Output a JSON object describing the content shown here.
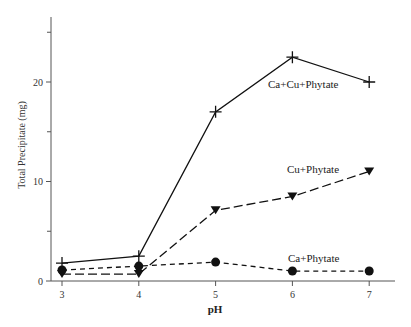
{
  "chart_data": {
    "type": "line",
    "title": "",
    "xlabel": "pH",
    "ylabel": "Total Precipitate (mg)",
    "x": [
      3,
      4,
      5,
      6,
      7
    ],
    "xticks": [
      "3",
      "4",
      "5",
      "6",
      "7"
    ],
    "yticks": [
      "0",
      "10",
      "20"
    ],
    "yminor_ticks": [
      5,
      15,
      25
    ],
    "ylim": [
      0,
      26.5
    ],
    "grid": false,
    "legend": "inline labels",
    "series": [
      {
        "name": "Ca+Cu+Phytate",
        "marker": "plus",
        "line": "solid",
        "values": [
          1.8,
          2.5,
          17.0,
          22.5,
          20.0
        ]
      },
      {
        "name": "Cu+Phytate",
        "marker": "triangle-down",
        "line": "long-dash",
        "values": [
          0.7,
          0.7,
          7.1,
          8.5,
          11.0
        ]
      },
      {
        "name": "Ca+Phytate",
        "marker": "circle",
        "line": "short-dash",
        "values": [
          1.1,
          1.5,
          1.9,
          1.0,
          1.0
        ]
      }
    ]
  }
}
